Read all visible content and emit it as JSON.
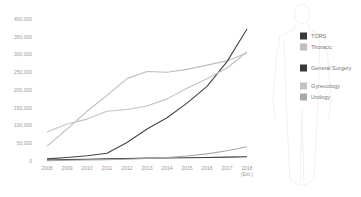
{
  "chart_data": {
    "type": "line",
    "title": "",
    "xlabel": "",
    "ylabel": "",
    "x": [
      "2008",
      "2009",
      "2010",
      "2011",
      "2012",
      "2013",
      "2014",
      "2015",
      "2016",
      "2017",
      "2018 (Est.)"
    ],
    "x_tick_labels": [
      "2008",
      "2009",
      "2010",
      "2011",
      "2012",
      "2013",
      "2014",
      "2015",
      "2016",
      "2017",
      "2018"
    ],
    "x_tick_sublabel": "(Est.)",
    "y_ticks": [
      0,
      50000,
      100000,
      150000,
      200000,
      250000,
      300000,
      350000,
      400000
    ],
    "y_tick_labels": [
      "0",
      "50,000",
      "100,000",
      "150,000",
      "200,000",
      "250,000",
      "300,000",
      "350,000",
      "400,000"
    ],
    "ylim": [
      0,
      400000
    ],
    "grid": false,
    "legend_position": "right",
    "series": [
      {
        "name": "TORS",
        "color": "#3a3a3a",
        "values": [
          3000,
          4000,
          5000,
          6000,
          7000,
          8000,
          8500,
          9000,
          10000,
          11000,
          12000
        ]
      },
      {
        "name": "Thoracic",
        "color": "#bdbdbd",
        "values": [
          42000,
          90000,
          140000,
          185000,
          232000,
          252000,
          250000,
          258000,
          270000,
          282000,
          305000
        ]
      },
      {
        "name": "General Surgery",
        "color": "#444444",
        "values": [
          6000,
          10000,
          15000,
          22000,
          52000,
          90000,
          122000,
          163000,
          210000,
          280000,
          372000
        ]
      },
      {
        "name": "Gynecology",
        "color": "#c2c2c2",
        "values": [
          82000,
          104000,
          118000,
          140000,
          145000,
          155000,
          175000,
          205000,
          232000,
          262000,
          307000
        ]
      },
      {
        "name": "Urology",
        "color": "#a8a8a8",
        "values": [
          1000,
          2000,
          3000,
          4000,
          5000,
          7000,
          10000,
          14000,
          20000,
          29000,
          40000
        ]
      }
    ]
  },
  "legend": [
    {
      "label": "TORS",
      "color": "#3a3a3a"
    },
    {
      "label": "Thoracic",
      "color": "#bdbdbd"
    },
    {
      "label": "General Surgery",
      "color": "#3a3a3a"
    },
    {
      "label": "Gynecology",
      "color": "#c2c2c2"
    },
    {
      "label": "Urology",
      "color": "#a8a8a8"
    }
  ]
}
